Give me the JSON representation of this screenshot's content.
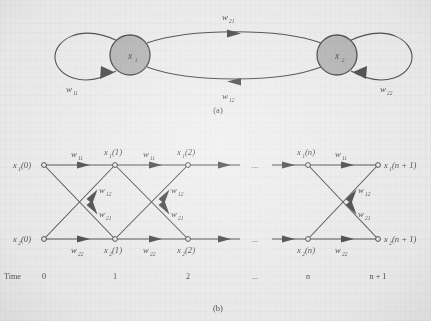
{
  "figure": {
    "panel_a_caption": "(a)",
    "panel_b_caption": "(b)",
    "background_color": "#ececec",
    "ink_color": "#262626",
    "node_fill_color": "#a9a9a9"
  },
  "panel_a": {
    "nodes": [
      {
        "id": "x1",
        "base": "x",
        "sub": "1",
        "cx": 130,
        "cy": 55,
        "r": 20
      },
      {
        "id": "x2",
        "base": "x",
        "sub": "2",
        "cx": 337,
        "cy": 55,
        "r": 20
      }
    ],
    "edges": [
      {
        "id": "self_x1",
        "base": "w",
        "sub": "11",
        "label_x": 72,
        "label_y": 92,
        "kind": "self-loop-left",
        "direction": "clockwise"
      },
      {
        "id": "x1_to_x2",
        "base": "w",
        "sub": "21",
        "label_x": 228,
        "label_y": 20,
        "kind": "curve-top",
        "direction": "left-to-right"
      },
      {
        "id": "x2_to_x1",
        "base": "w",
        "sub": "12",
        "label_x": 228,
        "label_y": 99,
        "kind": "curve-bottom",
        "direction": "right-to-left"
      },
      {
        "id": "self_x2",
        "base": "w",
        "sub": "22",
        "label_x": 386,
        "label_y": 92,
        "kind": "self-loop-right",
        "direction": "clockwise"
      }
    ]
  },
  "panel_b": {
    "row_top_y": 165,
    "row_bottom_y": 239,
    "columns": [
      {
        "index": 0,
        "x": 44,
        "time": "0",
        "top_label_base": "x",
        "top_label_sub": "1",
        "top_label_arg": "(0)",
        "bottom_label_base": "x",
        "bottom_label_sub": "2",
        "bottom_label_arg": "(0)"
      },
      {
        "index": 1,
        "x": 115,
        "time": "1",
        "top_label_base": "x",
        "top_label_sub": "1",
        "top_label_arg": "(1)",
        "bottom_label_base": "x",
        "bottom_label_sub": "2",
        "bottom_label_arg": "(1)"
      },
      {
        "index": 2,
        "x": 188,
        "time": "2",
        "top_label_base": "x",
        "top_label_sub": "1",
        "top_label_arg": "(2)",
        "bottom_label_base": "x",
        "bottom_label_sub": "2",
        "bottom_label_arg": "(2)"
      },
      {
        "index": 3,
        "x": 255,
        "time": "...",
        "top_label_base": "",
        "top_label_sub": "",
        "top_label_arg": "",
        "bottom_label_base": "",
        "bottom_label_sub": "",
        "bottom_label_arg": ""
      },
      {
        "index": 4,
        "x": 308,
        "time": "n",
        "top_label_base": "x",
        "top_label_sub": "1",
        "top_label_arg": "(n)",
        "bottom_label_base": "x",
        "bottom_label_sub": "2",
        "bottom_label_arg": "(n)"
      },
      {
        "index": 5,
        "x": 378,
        "time": "n + 1",
        "top_label_base": "x",
        "top_label_sub": "1",
        "top_label_arg": "(n + 1)",
        "bottom_label_base": "x",
        "bottom_label_sub": "2",
        "bottom_label_arg": "(n + 1)"
      }
    ],
    "ellipsis": "...",
    "time_axis_label": "Time",
    "time_axis_y": 276,
    "weights": {
      "top_horizontal": {
        "base": "w",
        "sub": "11"
      },
      "bottom_horizontal": {
        "base": "w",
        "sub": "22"
      },
      "up_diagonal": {
        "base": "w",
        "sub": "12"
      },
      "down_diagonal": {
        "base": "w",
        "sub": "21"
      }
    },
    "weight_labels": [
      {
        "id": "w11_a",
        "base": "w",
        "sub": "11",
        "x": 77,
        "y": 156
      },
      {
        "id": "w11_b",
        "base": "w",
        "sub": "11",
        "x": 149,
        "y": 156
      },
      {
        "id": "w11_c",
        "base": "w",
        "sub": "11",
        "x": 341,
        "y": 156
      },
      {
        "id": "w22_a",
        "base": "w",
        "sub": "22",
        "x": 77,
        "y": 253
      },
      {
        "id": "w22_b",
        "base": "w",
        "sub": "22",
        "x": 149,
        "y": 253
      },
      {
        "id": "w22_c",
        "base": "w",
        "sub": "22",
        "x": 341,
        "y": 253
      },
      {
        "id": "w12_a",
        "base": "w",
        "sub": "12",
        "x": 99,
        "y": 191
      },
      {
        "id": "w21_a",
        "base": "w",
        "sub": "21",
        "x": 99,
        "y": 215
      },
      {
        "id": "w12_b",
        "base": "w",
        "sub": "12",
        "x": 171,
        "y": 191
      },
      {
        "id": "w21_b",
        "base": "w",
        "sub": "21",
        "x": 171,
        "y": 215
      },
      {
        "id": "w12_c",
        "base": "w",
        "sub": "12",
        "x": 358,
        "y": 191
      },
      {
        "id": "w21_c",
        "base": "w",
        "sub": "21",
        "x": 358,
        "y": 215
      }
    ]
  }
}
